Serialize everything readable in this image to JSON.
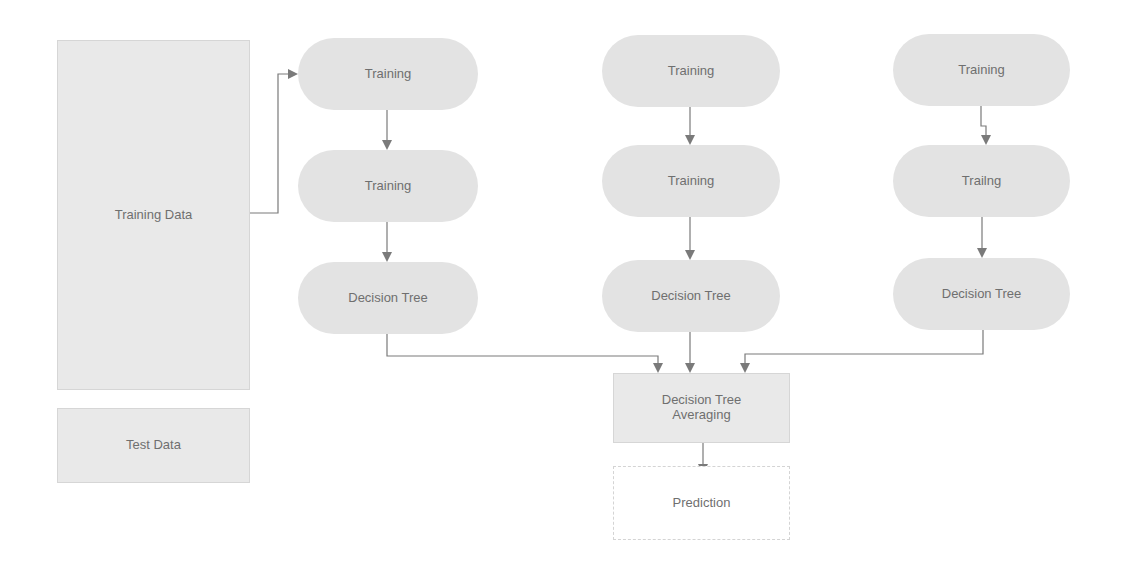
{
  "diagram": {
    "type": "flowchart",
    "title": "",
    "data_boxes": {
      "training_data": "Training Data",
      "test_data": "Test Data"
    },
    "columns": [
      {
        "step1": "Training",
        "step2": "Training",
        "step3": "Decision Tree"
      },
      {
        "step1": "Training",
        "step2": "Training",
        "step3": "Decision Tree"
      },
      {
        "step1": "Training",
        "step2": "Trailng",
        "step3": "Decision Tree"
      }
    ],
    "aggregate": {
      "line1": "Decision Tree",
      "line2": "Averaging"
    },
    "output": "Prediction",
    "edges": [
      [
        "Training Data",
        "column1.step1"
      ],
      [
        "column1.step1",
        "column1.step2"
      ],
      [
        "column1.step2",
        "column1.step3"
      ],
      [
        "column2.step1",
        "column2.step2"
      ],
      [
        "column2.step2",
        "column2.step3"
      ],
      [
        "column3.step1",
        "column3.step2"
      ],
      [
        "column3.step2",
        "column3.step3"
      ],
      [
        "column1.step3",
        "Decision Tree Averaging"
      ],
      [
        "column2.step3",
        "Decision Tree Averaging"
      ],
      [
        "column3.step3",
        "Decision Tree Averaging"
      ],
      [
        "Decision Tree Averaging",
        "Prediction"
      ]
    ],
    "colors": {
      "node_fill": "#e3e3e3",
      "text": "#6f6f6f",
      "edge": "#7a7a7a",
      "background": "#ffffff"
    }
  }
}
